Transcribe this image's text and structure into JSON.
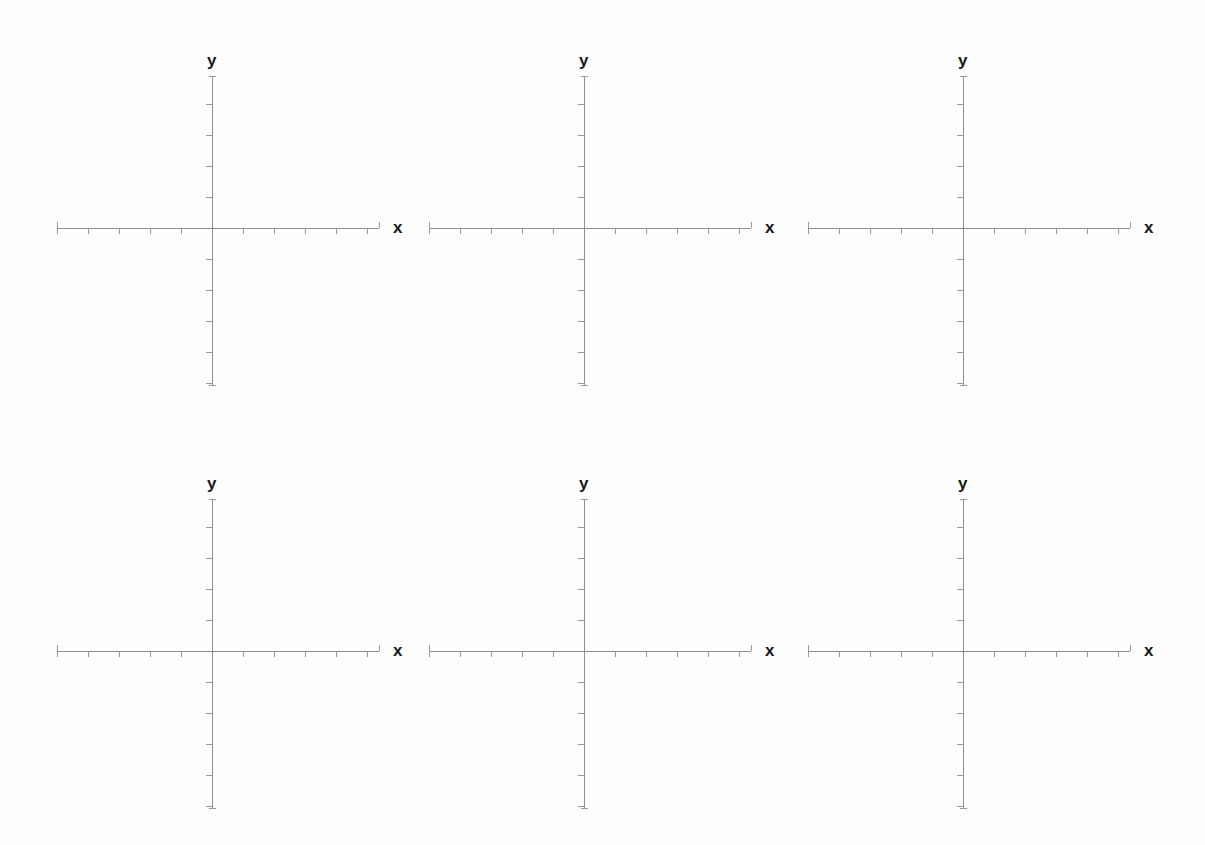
{
  "document": {
    "kind": "blank-coordinate-grid-worksheet",
    "background_color": "#ffffff",
    "axis_color": "#8e8e8e",
    "tick_color": "#9a9a9a",
    "label_color": "#18181a",
    "rows": 2,
    "columns": 3,
    "panel_count": 6
  },
  "chart_data": {
    "type": "scatter",
    "title": "",
    "subtitle": "",
    "xlabel": "x",
    "ylabel": "y",
    "grid": false,
    "legend": null,
    "annotations": [],
    "panels": [
      {
        "id": 1,
        "row": 1,
        "col": 1,
        "x_label": "x",
        "y_label": "y",
        "x_ticks": [
          -5,
          -4,
          -3,
          -2,
          -1,
          1,
          2,
          3,
          4,
          5
        ],
        "y_ticks": [
          -5,
          -4,
          -3,
          -2,
          -1,
          1,
          2,
          3,
          4,
          5
        ],
        "xlim": [
          -5.6,
          5.6
        ],
        "ylim": [
          -5.6,
          5.6
        ],
        "series": []
      },
      {
        "id": 2,
        "row": 1,
        "col": 2,
        "x_label": "x",
        "y_label": "y",
        "x_ticks": [
          -5,
          -4,
          -3,
          -2,
          -1,
          1,
          2,
          3,
          4,
          5
        ],
        "y_ticks": [
          -5,
          -4,
          -3,
          -2,
          -1,
          1,
          2,
          3,
          4,
          5
        ],
        "xlim": [
          -5.6,
          5.6
        ],
        "ylim": [
          -5.6,
          5.6
        ],
        "series": []
      },
      {
        "id": 3,
        "row": 1,
        "col": 3,
        "x_label": "x",
        "y_label": "y",
        "x_ticks": [
          -5,
          -4,
          -3,
          -2,
          -1,
          1,
          2,
          3,
          4,
          5
        ],
        "y_ticks": [
          -5,
          -4,
          -3,
          -2,
          -1,
          1,
          2,
          3,
          4,
          5
        ],
        "xlim": [
          -5.6,
          5.6
        ],
        "ylim": [
          -5.6,
          5.6
        ],
        "series": []
      },
      {
        "id": 4,
        "row": 2,
        "col": 1,
        "x_label": "x",
        "y_label": "y",
        "x_ticks": [
          -5,
          -4,
          -3,
          -2,
          -1,
          1,
          2,
          3,
          4,
          5
        ],
        "y_ticks": [
          -5,
          -4,
          -3,
          -2,
          -1,
          1,
          2,
          3,
          4,
          5
        ],
        "xlim": [
          -5.6,
          5.6
        ],
        "ylim": [
          -5.6,
          5.6
        ],
        "series": []
      },
      {
        "id": 5,
        "row": 2,
        "col": 2,
        "x_label": "x",
        "y_label": "y",
        "x_ticks": [
          -5,
          -4,
          -3,
          -2,
          -1,
          1,
          2,
          3,
          4,
          5
        ],
        "y_ticks": [
          -5,
          -4,
          -3,
          -2,
          -1,
          1,
          2,
          3,
          4,
          5
        ],
        "xlim": [
          -5.6,
          5.6
        ],
        "ylim": [
          -5.6,
          5.6
        ],
        "series": []
      },
      {
        "id": 6,
        "row": 2,
        "col": 3,
        "x_label": "x",
        "y_label": "y",
        "x_ticks": [
          -5,
          -4,
          -3,
          -2,
          -1,
          1,
          2,
          3,
          4,
          5
        ],
        "y_ticks": [
          -5,
          -4,
          -3,
          -2,
          -1,
          1,
          2,
          3,
          4,
          5
        ],
        "xlim": [
          -5.6,
          5.6
        ],
        "ylim": [
          -5.6,
          5.6
        ],
        "series": []
      }
    ]
  },
  "geometry": {
    "panel_origins_px": [
      {
        "x": 212,
        "y": 228
      },
      {
        "x": 584,
        "y": 228
      },
      {
        "x": 963,
        "y": 228
      },
      {
        "x": 212,
        "y": 651
      },
      {
        "x": 584,
        "y": 651
      },
      {
        "x": 963,
        "y": 651
      }
    ],
    "x_axis_span_px": {
      "left_from_origin": 155,
      "right_from_origin": 167
    },
    "y_axis_span_px": {
      "up_from_origin": 152,
      "down_from_origin": 157
    },
    "tick_spacing_px": 31,
    "tick_length_px": 6
  }
}
